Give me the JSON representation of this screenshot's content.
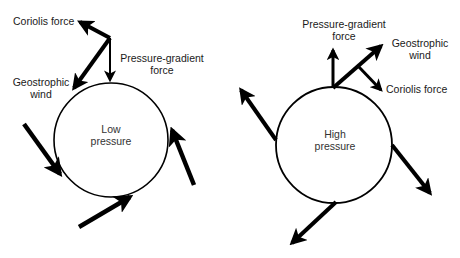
{
  "diagram": {
    "type": "wind-force-diagram",
    "panels": [
      {
        "id": "low",
        "center_label": [
          "Low",
          "pressure"
        ],
        "force_labels": {
          "coriolis": "Coriolis force",
          "pressure_gradient": [
            "Pressure-gradient",
            "force"
          ],
          "geostrophic": [
            "Geostrophic",
            "wind"
          ]
        },
        "rotation": "counterclockwise",
        "flow": "inward"
      },
      {
        "id": "high",
        "center_label": [
          "High",
          "pressure"
        ],
        "force_labels": {
          "coriolis": "Coriolis force",
          "pressure_gradient": [
            "Pressure-gradient",
            "force"
          ],
          "geostrophic": [
            "Geostrophic",
            "wind"
          ]
        },
        "rotation": "clockwise",
        "flow": "outward"
      }
    ],
    "colors": {
      "stroke": "#000000",
      "text": "#1a1a1a",
      "background": "#ffffff"
    }
  }
}
